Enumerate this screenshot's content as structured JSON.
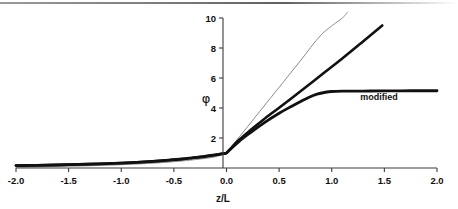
{
  "chart_data": {
    "type": "line",
    "title": "",
    "xlabel": "z/L",
    "ylabel": "φ",
    "xlim": [
      -2.0,
      2.0
    ],
    "ylim": [
      0,
      10
    ],
    "grid": false,
    "legend_position": "inline-annotation",
    "xticks": [
      "-2.0",
      "-1.5",
      "-1.0",
      "-0.5",
      "0.0",
      "0.5",
      "1.0",
      "1.5",
      "2.0"
    ],
    "xtick_values": [
      -2.0,
      -1.5,
      -1.0,
      -0.5,
      0.0,
      0.5,
      1.0,
      1.5,
      2.0
    ],
    "yticks": [
      "2",
      "4",
      "6",
      "8",
      "10"
    ],
    "ytick_values": [
      2,
      4,
      6,
      8,
      10
    ],
    "annotations": [
      {
        "text": "modified",
        "x": 1.45,
        "y": 4.55
      }
    ],
    "series": [
      {
        "name": "linear",
        "color": "#8c8c8c",
        "width": 1.0,
        "x": [
          -2.0,
          -1.75,
          -1.5,
          -1.25,
          -1.0,
          -0.75,
          -0.5,
          -0.35,
          -0.25,
          -0.18,
          -0.12,
          -0.08,
          -0.05,
          -0.03,
          -0.015,
          0.0,
          0.05,
          0.12,
          0.22,
          0.35,
          0.5,
          0.7,
          0.9,
          1.1,
          1.15
        ],
        "y": [
          0.05,
          0.08,
          0.12,
          0.16,
          0.22,
          0.3,
          0.42,
          0.52,
          0.6,
          0.66,
          0.73,
          0.8,
          0.86,
          0.91,
          0.95,
          1.0,
          1.45,
          2.06,
          2.93,
          4.07,
          5.38,
          7.13,
          8.88,
          10.0,
          10.4
        ]
      },
      {
        "name": "unmodified",
        "color": "#111111",
        "width": 2.6,
        "x": [
          -2.0,
          -1.8,
          -1.6,
          -1.4,
          -1.2,
          -1.0,
          -0.85,
          -0.7,
          -0.55,
          -0.42,
          -0.32,
          -0.24,
          -0.18,
          -0.13,
          -0.09,
          -0.06,
          -0.035,
          -0.015,
          0.0,
          0.05,
          0.12,
          0.22,
          0.35,
          0.5,
          0.7,
          0.9,
          1.1,
          1.3,
          1.48
        ],
        "y": [
          0.16,
          0.18,
          0.21,
          0.24,
          0.28,
          0.33,
          0.38,
          0.44,
          0.52,
          0.6,
          0.68,
          0.74,
          0.8,
          0.85,
          0.89,
          0.93,
          0.96,
          0.98,
          1.0,
          1.38,
          1.88,
          2.48,
          3.22,
          4.02,
          5.1,
          6.2,
          7.3,
          8.45,
          9.5
        ]
      },
      {
        "name": "modified",
        "color": "#111111",
        "width": 2.8,
        "x": [
          -2.0,
          -1.8,
          -1.6,
          -1.4,
          -1.2,
          -1.0,
          -0.85,
          -0.7,
          -0.55,
          -0.42,
          -0.32,
          -0.24,
          -0.18,
          -0.13,
          -0.09,
          -0.06,
          -0.035,
          -0.015,
          0.0,
          0.05,
          0.12,
          0.22,
          0.35,
          0.5,
          0.62,
          0.7,
          0.78,
          0.86,
          0.94,
          1.0,
          1.1,
          1.3,
          1.5,
          1.75,
          2.0
        ],
        "y": [
          0.16,
          0.18,
          0.21,
          0.24,
          0.28,
          0.33,
          0.38,
          0.44,
          0.52,
          0.6,
          0.68,
          0.74,
          0.8,
          0.85,
          0.89,
          0.93,
          0.96,
          0.98,
          1.0,
          1.33,
          1.78,
          2.32,
          2.98,
          3.65,
          4.12,
          4.42,
          4.7,
          4.92,
          5.05,
          5.1,
          5.12,
          5.13,
          5.14,
          5.15,
          5.15
        ]
      }
    ]
  },
  "axes": {
    "x_axis_name": "z/L",
    "y_axis_name": "φ"
  }
}
